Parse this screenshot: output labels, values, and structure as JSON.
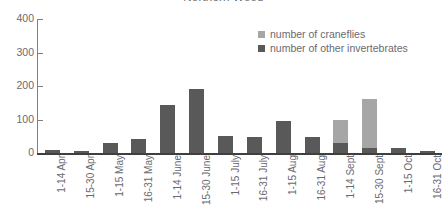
{
  "chart_data": {
    "type": "bar",
    "subtype": "stacked-bar",
    "title": "Northern Wood",
    "xlabel": "",
    "ylabel": "",
    "ylim": [
      0,
      400
    ],
    "yticks": [
      0,
      100,
      200,
      300,
      400
    ],
    "ytick_labels": [
      "0",
      "100",
      "200",
      "300",
      "400"
    ],
    "grid": false,
    "legend_position": "top-right",
    "categories": [
      "1-14 Apr",
      "15-30 Apr",
      "1-15 May",
      "16-31 May",
      "1-14 June",
      "15-30 June",
      "1-15 July",
      "16-31 July",
      "1-15 Aug",
      "16-31 Aug",
      "1-14 Sept",
      "15-30 Sept",
      "1-15 Oct",
      "16-31 Oct"
    ],
    "series": [
      {
        "name": "number of craneflies",
        "color": "#a6a6a6",
        "values": [
          0,
          0,
          0,
          0,
          0,
          0,
          0,
          0,
          0,
          0,
          70,
          145,
          0,
          0
        ]
      },
      {
        "name": "number of other invertebrates",
        "color": "#595959",
        "values": [
          8,
          5,
          30,
          42,
          143,
          191,
          50,
          48,
          95,
          48,
          30,
          15,
          14,
          6
        ]
      }
    ],
    "totals": [
      8,
      5,
      30,
      42,
      143,
      191,
      50,
      48,
      95,
      48,
      100,
      160,
      14,
      6
    ]
  },
  "colors": {
    "craneflies": "#a6a6a6",
    "other_invertebrates": "#595959",
    "axis": "#808080",
    "baseline": "#3f3f3f",
    "text": "#6a6a72",
    "background": "#ffffff"
  }
}
